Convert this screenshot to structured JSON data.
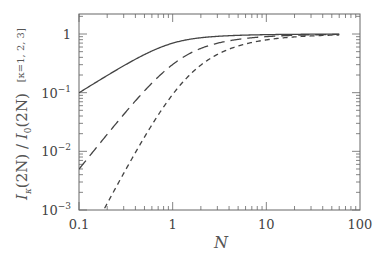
{
  "chart_data": {
    "type": "line",
    "title": "",
    "xlabel": "N",
    "ylabel": "I_κ(2N) / I_0(2N)",
    "ylabel_annotation": "[κ=1, 2, 3]",
    "xscale": "log",
    "yscale": "log",
    "xlim": [
      0.1,
      100
    ],
    "ylim": [
      0.001,
      2
    ],
    "grid": false,
    "legend": "none",
    "x_ticks": [
      {
        "value": 0.1,
        "label": "0.1"
      },
      {
        "value": 1,
        "label": "1"
      },
      {
        "value": 10,
        "label": "10"
      },
      {
        "value": 100,
        "label": "100"
      }
    ],
    "y_ticks": [
      {
        "value": 1,
        "label": "1",
        "exp": ""
      },
      {
        "value": 0.1,
        "label": "10",
        "exp": "−1"
      },
      {
        "value": 0.01,
        "label": "10",
        "exp": "−2"
      },
      {
        "value": 0.001,
        "label": "10",
        "exp": "−3"
      }
    ],
    "x": [
      0.1,
      0.2,
      0.3,
      0.5,
      1,
      2,
      3,
      5,
      10,
      20,
      60
    ],
    "series": [
      {
        "name": "κ=1",
        "style": "solid",
        "values": [
          0.0995,
          0.1942,
          0.2791,
          0.4464,
          0.6978,
          0.8635,
          0.9124,
          0.9486,
          0.9747,
          0.9874,
          0.9958
        ]
      },
      {
        "name": "κ=2",
        "style": "long-dash",
        "values": [
          0.00497,
          0.01948,
          0.04186,
          0.1072,
          0.3022,
          0.5682,
          0.6959,
          0.8103,
          0.9015,
          0.9502,
          0.9834
        ]
      },
      {
        "name": "κ=3",
        "style": "short-dash",
        "values": [
          0.000165,
          0.001295,
          0.004187,
          0.01751,
          0.0933,
          0.2953,
          0.4501,
          0.6245,
          0.7918,
          0.8924,
          0.963
        ]
      }
    ],
    "colors": {
      "line": "#444444",
      "axis": "#666666"
    }
  },
  "labels": {
    "xlabel": "N",
    "ylabel_I": "I",
    "ylabel_k": "κ",
    "ylabel_mid": "(2N) / ",
    "ylabel_I0": "I",
    "ylabel_0": "0",
    "ylabel_end": "(2N)",
    "ylabel_annotation": "[κ=1, 2, 3]"
  }
}
